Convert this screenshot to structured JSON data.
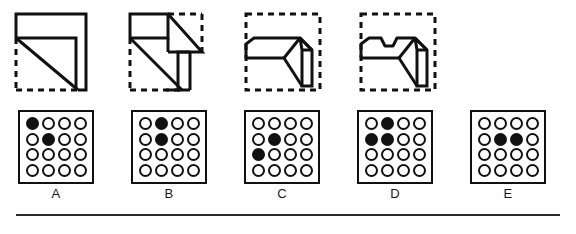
{
  "puzzle": {
    "kind": "visual-multiple-choice",
    "figure_count": 4,
    "option_count": 5,
    "grid_rows": 4,
    "grid_cols": 4,
    "colors": {
      "ink": "#111111",
      "paper": "#ffffff",
      "rule": "#2b2b2b"
    }
  },
  "figures": [
    {
      "name": "figure-1",
      "description": "square outline with L-shaped bracket and diagonal",
      "solid_edges": "top,right",
      "dashed_edges": "left,bottom"
    },
    {
      "name": "figure-2",
      "description": "stepped staircase block with long diagonal",
      "solid_edges": "top-left,right-lower",
      "dashed_edges": "left,bottom,top-right"
    },
    {
      "name": "figure-3",
      "description": "wedge with chamfered left end and three-dimensional box at right",
      "solid_edges": "none",
      "dashed_edges": "top,left,bottom,right"
    },
    {
      "name": "figure-4",
      "description": "wedge with notched top edge and three-dimensional box at right",
      "solid_edges": "none",
      "dashed_edges": "top,left,bottom,right"
    }
  ],
  "options": [
    {
      "label": "A",
      "name": "option-a",
      "dots": [
        [
          1,
          0,
          0,
          0
        ],
        [
          0,
          1,
          0,
          0
        ],
        [
          0,
          0,
          0,
          0
        ],
        [
          0,
          0,
          0,
          0
        ]
      ]
    },
    {
      "label": "B",
      "name": "option-b",
      "dots": [
        [
          0,
          1,
          0,
          0
        ],
        [
          0,
          1,
          0,
          0
        ],
        [
          0,
          0,
          0,
          0
        ],
        [
          0,
          0,
          0,
          0
        ]
      ]
    },
    {
      "label": "C",
      "name": "option-c",
      "dots": [
        [
          0,
          0,
          0,
          0
        ],
        [
          0,
          1,
          0,
          0
        ],
        [
          1,
          0,
          0,
          0
        ],
        [
          0,
          0,
          0,
          0
        ]
      ]
    },
    {
      "label": "D",
      "name": "option-d",
      "dots": [
        [
          0,
          1,
          0,
          0
        ],
        [
          1,
          1,
          0,
          0
        ],
        [
          0,
          0,
          0,
          0
        ],
        [
          0,
          0,
          0,
          0
        ]
      ]
    },
    {
      "label": "E",
      "name": "option-e",
      "dots": [
        [
          0,
          0,
          0,
          0
        ],
        [
          0,
          1,
          1,
          0
        ],
        [
          0,
          0,
          0,
          0
        ],
        [
          0,
          0,
          0,
          0
        ]
      ]
    }
  ]
}
